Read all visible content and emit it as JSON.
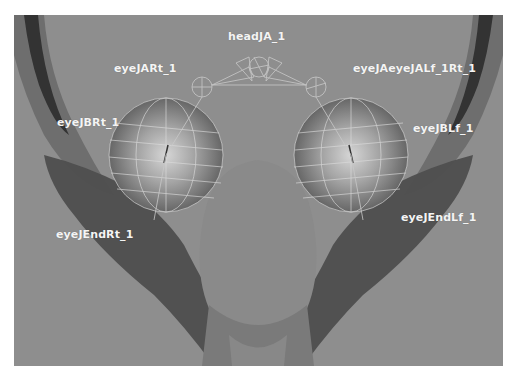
{
  "viewport": {
    "background": "#8e8e8e",
    "joint_labels": [
      {
        "id": "headJA",
        "text": "headJA_1",
        "x": 214,
        "y": 15
      },
      {
        "id": "eyeJARt",
        "text": "eyeJARt_1",
        "x": 100,
        "y": 47
      },
      {
        "id": "eyeJALf",
        "text": "eyeJAeyeJALf_1Rt_1",
        "x": 339,
        "y": 47
      },
      {
        "id": "eyeJBRt",
        "text": "eyeJBRt_1",
        "x": 43,
        "y": 101
      },
      {
        "id": "eyeJBLf",
        "text": "eyeJBLf_1",
        "x": 399,
        "y": 107
      },
      {
        "id": "eyeJEndRt",
        "text": "eyeJEndRt_1",
        "x": 42,
        "y": 213
      },
      {
        "id": "eyeJEndLf",
        "text": "eyeJEndLf_1",
        "x": 387,
        "y": 196
      }
    ]
  }
}
